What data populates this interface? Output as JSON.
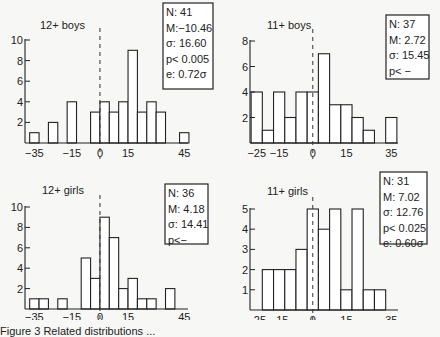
{
  "chart_data": [
    {
      "type": "bar",
      "title": "12+ boys",
      "xlabel": "",
      "ylabel": "",
      "xlim": [
        -40,
        47
      ],
      "ylim": [
        0,
        10
      ],
      "xticks": [
        -35,
        -15,
        0,
        15,
        45
      ],
      "yticks": [
        2,
        4,
        6,
        8,
        10
      ],
      "bin_width": 5,
      "bins": [
        {
          "x": -35,
          "count": 1
        },
        {
          "x": -25,
          "count": 2
        },
        {
          "x": -15,
          "count": 4
        },
        {
          "x": -2.5,
          "count": 3
        },
        {
          "x": 2.5,
          "count": 4
        },
        {
          "x": 7.5,
          "count": 3
        },
        {
          "x": 12.5,
          "count": 4
        },
        {
          "x": 17.5,
          "count": 9
        },
        {
          "x": 22.5,
          "count": 3
        },
        {
          "x": 27.5,
          "count": 4
        },
        {
          "x": 32.5,
          "count": 3
        },
        {
          "x": 45,
          "count": 1
        }
      ],
      "reference_line": 0,
      "stats": [
        "N: 41",
        "M:−10.46",
        "σ: 16.60",
        "p< 0.005",
        "e: 0.72σ"
      ]
    },
    {
      "type": "bar",
      "title": "11+ boys",
      "xlabel": "",
      "ylabel": "",
      "xlim": [
        -28,
        38
      ],
      "ylim": [
        0,
        8
      ],
      "xticks": [
        -25,
        -15,
        0,
        15,
        35
      ],
      "yticks": [
        2,
        4,
        6,
        8
      ],
      "bin_width": 5,
      "bins": [
        {
          "x": -25,
          "count": 4
        },
        {
          "x": -20,
          "count": 1
        },
        {
          "x": -15,
          "count": 4
        },
        {
          "x": -10,
          "count": 2
        },
        {
          "x": -5,
          "count": 4
        },
        {
          "x": 0,
          "count": 4
        },
        {
          "x": 5,
          "count": 7
        },
        {
          "x": 10,
          "count": 3
        },
        {
          "x": 15,
          "count": 3
        },
        {
          "x": 20,
          "count": 2
        },
        {
          "x": 25,
          "count": 1
        },
        {
          "x": 35,
          "count": 2
        }
      ],
      "reference_line": 0,
      "stats": [
        "N: 37",
        "M: 2.72",
        "σ: 15.45",
        "p< −"
      ]
    },
    {
      "type": "bar",
      "title": "12+ girls",
      "xlabel": "",
      "ylabel": "",
      "xlim": [
        -40,
        47
      ],
      "ylim": [
        0,
        10
      ],
      "xticks": [
        -35,
        -15,
        0,
        15,
        45
      ],
      "yticks": [
        2,
        4,
        6,
        8,
        10
      ],
      "bin_width": 5,
      "bins": [
        {
          "x": -35,
          "count": 1
        },
        {
          "x": -30,
          "count": 1
        },
        {
          "x": -20,
          "count": 1
        },
        {
          "x": -7.5,
          "count": 5
        },
        {
          "x": -2.5,
          "count": 3
        },
        {
          "x": 2.5,
          "count": 9
        },
        {
          "x": 7.5,
          "count": 7
        },
        {
          "x": 12.5,
          "count": 2
        },
        {
          "x": 17.5,
          "count": 3
        },
        {
          "x": 22.5,
          "count": 1
        },
        {
          "x": 27.5,
          "count": 1
        },
        {
          "x": 37.5,
          "count": 2
        }
      ],
      "reference_line": 0,
      "stats": [
        "N: 36",
        "M: 4.18",
        "σ: 14.41",
        "p<−"
      ]
    },
    {
      "type": "bar",
      "title": "11+ girls",
      "xlabel": "",
      "ylabel": "",
      "xlim": [
        -28,
        38
      ],
      "ylim": [
        0,
        5
      ],
      "xticks": [
        -25,
        -15,
        0,
        15,
        35
      ],
      "yticks": [
        1,
        2,
        3,
        4,
        5
      ],
      "bin_width": 5,
      "bins": [
        {
          "x": -20,
          "count": 2
        },
        {
          "x": -15,
          "count": 2
        },
        {
          "x": -10,
          "count": 2
        },
        {
          "x": -5,
          "count": 3
        },
        {
          "x": 0,
          "count": 5
        },
        {
          "x": 5,
          "count": 4
        },
        {
          "x": 10,
          "count": 5
        },
        {
          "x": 15,
          "count": 1
        },
        {
          "x": 20,
          "count": 5
        },
        {
          "x": 25,
          "count": 1
        },
        {
          "x": 30,
          "count": 1
        }
      ],
      "reference_line": 0,
      "stats": [
        "N: 31",
        "M: 7.02",
        "σ: 12.76",
        "p< 0.025",
        "e: 0.60σ"
      ]
    }
  ],
  "caption": "Figure 3   Related distributions ..."
}
